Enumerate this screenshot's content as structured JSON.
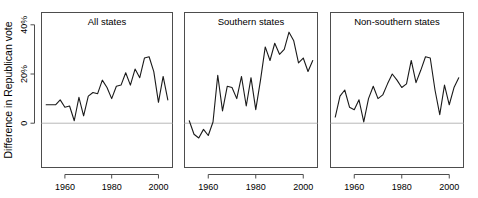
{
  "figure": {
    "y_axis_label": "Difference in Republican vote"
  },
  "chart_data": {
    "type": "line",
    "title": "",
    "xlabel": "",
    "ylabel": "Difference in Republican vote",
    "grid": false,
    "legend_position": "none",
    "layout": "1 row x 3 columns of panels, shared y axis",
    "xlim": [
      1950,
      2006
    ],
    "ylim": [
      -18,
      45
    ],
    "yticks": [
      0,
      20,
      40
    ],
    "ytick_labels": [
      "0",
      "20%",
      "40%"
    ],
    "xticks": [
      1960,
      1980,
      2000
    ],
    "xtick_labels": [
      "1960",
      "1980",
      "2000"
    ],
    "zero_reference_line": 0,
    "panels": [
      {
        "title": "All states",
        "x": [
          1952,
          1954,
          1956,
          1958,
          1960,
          1962,
          1964,
          1966,
          1968,
          1970,
          1972,
          1974,
          1976,
          1978,
          1980,
          1982,
          1984,
          1986,
          1988,
          1990,
          1992,
          1994,
          1996,
          1998,
          2000,
          2002,
          2004
        ],
        "values": [
          7.5,
          7.5,
          7.5,
          9.5,
          6.5,
          7.0,
          1.0,
          10.5,
          3.0,
          11.0,
          12.5,
          12.0,
          17.5,
          14.5,
          10.0,
          15.0,
          15.5,
          20.5,
          15.5,
          22.0,
          18.5,
          26.5,
          27.0,
          21.0,
          8.5,
          19.0,
          9.5
        ]
      },
      {
        "title": "Southern states",
        "x": [
          1952,
          1954,
          1956,
          1958,
          1960,
          1962,
          1964,
          1966,
          1968,
          1970,
          1972,
          1974,
          1976,
          1978,
          1980,
          1982,
          1984,
          1986,
          1988,
          1990,
          1992,
          1994,
          1996,
          1998,
          2000,
          2002,
          2004
        ],
        "values": [
          1.0,
          -4.5,
          -6.0,
          -2.5,
          -5.0,
          0.5,
          19.5,
          5.0,
          15.0,
          14.5,
          10.0,
          19.0,
          7.0,
          18.5,
          5.5,
          17.5,
          31.0,
          25.5,
          32.5,
          28.0,
          30.0,
          37.0,
          33.5,
          24.5,
          26.5,
          21.0,
          25.5
        ]
      },
      {
        "title": "Non-southern states",
        "x": [
          1952,
          1954,
          1956,
          1958,
          1960,
          1962,
          1964,
          1966,
          1968,
          1970,
          1972,
          1974,
          1976,
          1978,
          1980,
          1982,
          1984,
          1986,
          1988,
          1990,
          1992,
          1994,
          1996,
          1998,
          2000,
          2002,
          2004
        ],
        "values": [
          2.5,
          11.0,
          13.5,
          6.5,
          5.5,
          9.5,
          0.5,
          10.0,
          15.0,
          10.0,
          11.5,
          16.0,
          20.0,
          17.5,
          14.5,
          16.0,
          25.5,
          16.5,
          21.5,
          27.0,
          26.5,
          13.5,
          3.5,
          15.5,
          7.5,
          14.5,
          18.5
        ]
      }
    ]
  }
}
